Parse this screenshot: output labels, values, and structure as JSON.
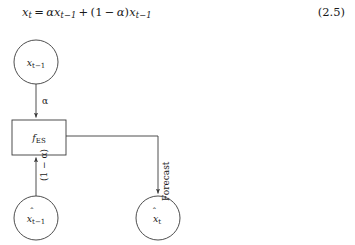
{
  "equation": {
    "latex": "\\hat{x}_t = \\alpha x_{t-1} + (1-\\alpha)\\hat{x}_{t-1}",
    "plain": "x̂t = αx(t−1) + (1−α)x̂(t−1)",
    "number": "(2.5)",
    "lhs_base": "x",
    "lhs_sub": "t",
    "alpha": "α",
    "rhs_first_base": "x",
    "rhs_first_sub": "t−1",
    "plus": "+",
    "paren_open": "(",
    "one": "1",
    "minus": "−",
    "paren_close": ")",
    "rhs_second_base": "x",
    "rhs_second_sub": "t−1",
    "equals": "="
  },
  "diagram": {
    "type": "flow-diagram",
    "nodes": [
      {
        "id": "observation",
        "shape": "circle",
        "label_base": "x",
        "label_sub": "t−1",
        "hat": false,
        "cx": 36,
        "cy": 36,
        "r": 22
      },
      {
        "id": "es-function",
        "shape": "rectangle",
        "label_base": "f",
        "label_sub": "ES",
        "x": 12,
        "y": 94,
        "w": 54,
        "h": 35
      },
      {
        "id": "previous-forecast",
        "shape": "circle",
        "label_base": "x",
        "label_sub": "t−1",
        "hat": true,
        "cx": 36,
        "cy": 192,
        "r": 22
      },
      {
        "id": "current-forecast",
        "shape": "circle",
        "label_base": "x",
        "label_sub": "t",
        "hat": true,
        "cx": 158,
        "cy": 192,
        "r": 22
      }
    ],
    "edges": [
      {
        "id": "alpha-edge",
        "from": "observation",
        "to": "es-function",
        "label": "α",
        "label_rotated": false,
        "arrow": true
      },
      {
        "id": "one-minus-alpha-edge",
        "from": "previous-forecast",
        "to": "es-function",
        "label": "(1 − α)",
        "label_rotated": true,
        "arrow": true
      },
      {
        "id": "forecast-edge",
        "from": "es-function",
        "to": "current-forecast",
        "label": "Forecast",
        "label_rotated": true,
        "arrow": true
      }
    ],
    "colors": {
      "stroke": "#3a3a3a",
      "text": "#1a1a1a",
      "background": "#ffffff"
    }
  }
}
